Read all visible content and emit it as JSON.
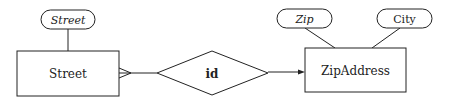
{
  "diagram": {
    "type": "er-diagram",
    "entities": [
      {
        "id": "street",
        "label": "Street"
      },
      {
        "id": "zipaddress",
        "label": "ZipAddress"
      }
    ],
    "attributes": [
      {
        "entity": "street",
        "label": "Street",
        "key": true
      },
      {
        "entity": "zipaddress",
        "label": "Zip",
        "key": true
      },
      {
        "entity": "zipaddress",
        "label": "City",
        "key": false
      }
    ],
    "relationships": [
      {
        "label": "id",
        "from": "street",
        "to": "zipaddress",
        "from_cardinality": "many",
        "to_cardinality": "one"
      }
    ],
    "colors": {
      "stroke": "#222222",
      "background": "#ffffff"
    }
  }
}
